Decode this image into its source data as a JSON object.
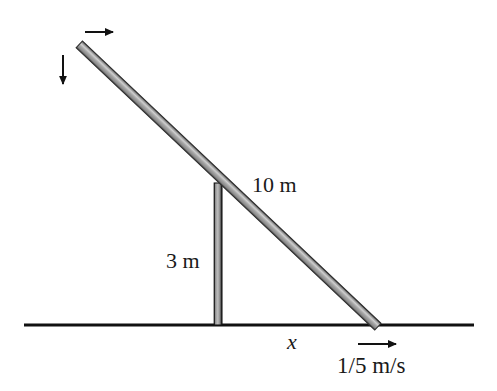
{
  "figure": {
    "type": "physics-diagram",
    "background_color": "#ffffff"
  },
  "labels": {
    "ladder_length": "10 m",
    "pole_height": "3 m",
    "base_distance": "x",
    "base_speed": "1/5 m/s"
  },
  "icons": {
    "velocity_right_top": "arrow-right-icon",
    "velocity_down_top": "arrow-down-icon",
    "velocity_right_base": "arrow-right-icon"
  },
  "colors": {
    "ink": "#1a1a1a",
    "ground": "#111111",
    "rod_edge": "#3a3a3a",
    "rod_fill": "#a8a8a8",
    "rod_highlight": "#d0d0d0",
    "pole_edge": "#1a1a1a",
    "pole_fill": "#9c9c9c"
  },
  "geometry": {
    "ground_line": {
      "x1": 24,
      "y1": 325,
      "x2": 474,
      "y2": 325,
      "thickness": 3
    },
    "ladder": {
      "x1": 80,
      "y1": 45,
      "x2": 378,
      "y2": 327,
      "thickness": 9
    },
    "pole": {
      "x": 214,
      "y_top": 183,
      "y_bottom": 325,
      "width": 8
    },
    "arrow_top_horizontal": {
      "x1": 85,
      "y1": 32,
      "x2": 118,
      "y2": 32
    },
    "arrow_top_vertical": {
      "x1": 63,
      "y1": 55,
      "x2": 63,
      "y2": 89
    },
    "arrow_base_horizontal": {
      "x1": 358,
      "y1": 344,
      "x2": 401,
      "y2": 344
    }
  }
}
